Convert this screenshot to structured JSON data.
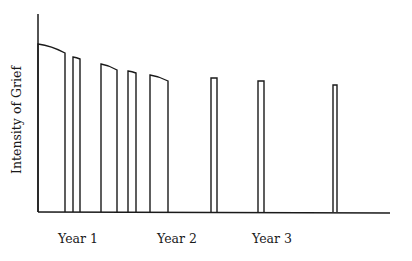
{
  "chart_data": {
    "type": "bar",
    "title": "",
    "xlabel": "",
    "ylabel": "Intensity of Grief",
    "x_tick_labels": [
      {
        "label": "Year 1",
        "x_px": 78
      },
      {
        "label": "Year 2",
        "x_px": 177
      },
      {
        "label": "Year 3",
        "x_px": 272
      }
    ],
    "grid": false,
    "legend": null,
    "bars": [
      {
        "x0": 38,
        "x1": 65,
        "top_left": 44,
        "top_right": 53
      },
      {
        "x0": 73,
        "x1": 80,
        "top_left": 57,
        "top_right": 59
      },
      {
        "x0": 101,
        "x1": 117,
        "top_left": 64,
        "top_right": 70
      },
      {
        "x0": 128,
        "x1": 136,
        "top_left": 71,
        "top_right": 73
      },
      {
        "x0": 150,
        "x1": 168,
        "top_left": 75,
        "top_right": 81
      },
      {
        "x0": 211,
        "x1": 217,
        "top_left": 78,
        "top_right": 78
      },
      {
        "x0": 258,
        "x1": 264,
        "top_left": 81,
        "top_right": 81
      },
      {
        "x0": 333,
        "x1": 337,
        "top_left": 85,
        "top_right": 85
      }
    ],
    "relative_intensity": [
      84,
      77,
      72,
      70,
      67,
      68,
      66,
      64
    ],
    "axes": {
      "origin_x": 38,
      "baseline_y": 212,
      "y_top": 14,
      "x_end": 390
    },
    "colors": {
      "stroke": "#1a1a1a",
      "background": "#ffffff"
    }
  }
}
